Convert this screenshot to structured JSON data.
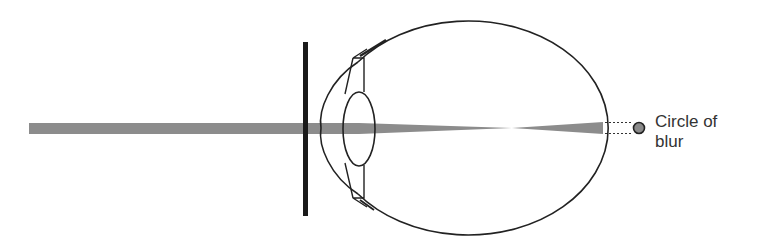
{
  "diagram": {
    "label": {
      "line1": "Circle of",
      "line2": "blur"
    },
    "colors": {
      "beam": "#8c8c8c",
      "outline": "#222222",
      "pupil_bar": "#1a1a1a",
      "blur_dot": "#8a8a8a",
      "background": "#ffffff"
    },
    "elements": [
      "incoming-light-beam",
      "aperture-bar",
      "cornea",
      "lens",
      "eyeball",
      "focal-point",
      "retina-blur-cone",
      "dotted-projection-lines",
      "circle-of-blur-dot"
    ]
  }
}
